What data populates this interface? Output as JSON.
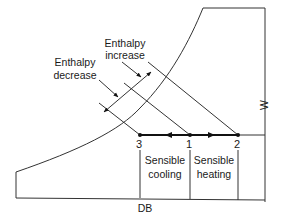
{
  "diagram": {
    "type": "psychrometric-chart-schematic",
    "axes": {
      "x_label": "DB",
      "y_label": "W"
    },
    "points": [
      {
        "id": "3",
        "label": "3"
      },
      {
        "id": "1",
        "label": "1"
      },
      {
        "id": "2",
        "label": "2"
      }
    ],
    "regions": {
      "cooling": {
        "line1": "Sensible",
        "line2": "cooling"
      },
      "heating": {
        "line1": "Sensible",
        "line2": "heating"
      }
    },
    "annotations": {
      "enthalpy_increase": {
        "line1": "Enthalpy",
        "line2": "increase"
      },
      "enthalpy_decrease": {
        "line1": "Enthalpy",
        "line2": "decrease"
      }
    },
    "colors": {
      "line": "#333333",
      "text": "#1a1a1a",
      "background": "#ffffff"
    }
  }
}
